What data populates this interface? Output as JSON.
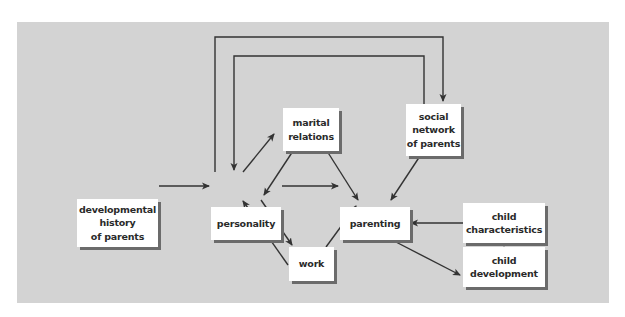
{
  "diagram": {
    "background_color": "#d3d3d3",
    "box_color": "#ffffff",
    "shadow_color": "#6b6b6b",
    "line_color": "#333333",
    "nodes": [
      {
        "id": "developmental_history",
        "label": "developmental\nhistory\nof parents"
      },
      {
        "id": "personality",
        "label": "personality"
      },
      {
        "id": "marital_relations",
        "label": "marital\nrelations"
      },
      {
        "id": "social_network",
        "label": "social\nnetwork\nof parents"
      },
      {
        "id": "parenting",
        "label": "parenting"
      },
      {
        "id": "child_characteristics",
        "label": "child\ncharacteristics"
      },
      {
        "id": "work",
        "label": "work"
      },
      {
        "id": "child_development",
        "label": "child\ndevelopment"
      }
    ],
    "edges": [
      {
        "from": "developmental_history",
        "to": "personality"
      },
      {
        "from": "personality",
        "to": "parenting"
      },
      {
        "from": "personality",
        "to": "marital_relations"
      },
      {
        "from": "marital_relations",
        "to": "personality"
      },
      {
        "from": "marital_relations",
        "to": "parenting"
      },
      {
        "from": "personality",
        "to": "social_network"
      },
      {
        "from": "social_network",
        "to": "personality"
      },
      {
        "from": "social_network",
        "to": "parenting"
      },
      {
        "from": "personality",
        "to": "work"
      },
      {
        "from": "work",
        "to": "personality"
      },
      {
        "from": "work",
        "to": "parenting"
      },
      {
        "from": "child_characteristics",
        "to": "parenting"
      },
      {
        "from": "child_characteristics",
        "to": "child_development"
      },
      {
        "from": "parenting",
        "to": "child_development"
      }
    ]
  }
}
